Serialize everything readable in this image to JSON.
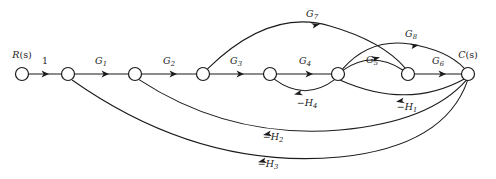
{
  "figure": {
    "type": "signal-flow-graph",
    "background_color": "#ffffff",
    "stroke_color": "#1b1b1b",
    "width": 496,
    "height": 179
  },
  "nodes": [
    {
      "id": "n0",
      "label": "R(s)",
      "label_italic_part": "R",
      "label_arg": "(s)",
      "x": 22,
      "y": 74,
      "r": 6.5,
      "label_x": 22,
      "label_y": 57,
      "kind": "input"
    },
    {
      "id": "n1",
      "label": "",
      "x": 68,
      "y": 74,
      "r": 6.5,
      "kind": "mixing"
    },
    {
      "id": "n2",
      "label": "",
      "x": 135,
      "y": 74,
      "r": 6.5,
      "kind": "mixing"
    },
    {
      "id": "n3",
      "label": "",
      "x": 203,
      "y": 74,
      "r": 6.5,
      "kind": "mixing"
    },
    {
      "id": "n4",
      "label": "",
      "x": 270,
      "y": 74,
      "r": 6.5,
      "kind": "mixing"
    },
    {
      "id": "n5",
      "label": "",
      "x": 338,
      "y": 74,
      "r": 6.5,
      "kind": "mixing"
    },
    {
      "id": "n6",
      "label": "",
      "x": 408,
      "y": 74,
      "r": 6.5,
      "kind": "mixing"
    },
    {
      "id": "n7",
      "label": "C(s)",
      "label_italic_part": "C",
      "label_arg": "(s)",
      "x": 468,
      "y": 74,
      "r": 6.5,
      "label_x": 468,
      "label_y": 57,
      "kind": "output"
    }
  ],
  "edges": [
    {
      "id": "e1",
      "from": "n0",
      "to": "n1",
      "gain": "1",
      "gain_base": "1",
      "gain_sub": "",
      "gain_negative": false,
      "shape": "straight",
      "label_x": 45,
      "label_y": 64,
      "direction": "right"
    },
    {
      "id": "e2",
      "from": "n1",
      "to": "n2",
      "gain": "G1",
      "gain_base": "G",
      "gain_sub": "1",
      "gain_negative": false,
      "shape": "straight",
      "label_x": 101,
      "label_y": 64,
      "direction": "right"
    },
    {
      "id": "e3",
      "from": "n2",
      "to": "n3",
      "gain": "G2",
      "gain_base": "G",
      "gain_sub": "2",
      "gain_negative": false,
      "shape": "straight",
      "label_x": 169,
      "label_y": 64,
      "direction": "right"
    },
    {
      "id": "e4",
      "from": "n3",
      "to": "n4",
      "gain": "G3",
      "gain_base": "G",
      "gain_sub": "3",
      "gain_negative": false,
      "shape": "straight",
      "label_x": 236,
      "label_y": 64,
      "direction": "right"
    },
    {
      "id": "e5",
      "from": "n4",
      "to": "n5",
      "gain": "G4",
      "gain_base": "G",
      "gain_sub": "4",
      "gain_negative": false,
      "shape": "straight",
      "label_x": 305,
      "label_y": 64,
      "direction": "right"
    },
    {
      "id": "e6",
      "from": "n5",
      "to": "n6",
      "gain": "G5",
      "gain_base": "G",
      "gain_sub": "5",
      "gain_negative": false,
      "shape": "arc-up",
      "label_x": 372,
      "label_y": 63,
      "direction": "right"
    },
    {
      "id": "e7",
      "from": "n6",
      "to": "n7",
      "gain": "G6",
      "gain_base": "G",
      "gain_sub": "6",
      "gain_negative": false,
      "shape": "straight",
      "label_x": 438,
      "label_y": 64,
      "direction": "right"
    },
    {
      "id": "e8",
      "from": "n3",
      "to": "n6",
      "gain": "G7",
      "gain_base": "G",
      "gain_sub": "7",
      "gain_negative": false,
      "shape": "arc-up-tall",
      "label_x": 312,
      "label_y": 17,
      "direction": "right"
    },
    {
      "id": "e9",
      "from": "n5",
      "to": "n7",
      "gain": "G8",
      "gain_base": "G",
      "gain_sub": "8",
      "gain_negative": false,
      "shape": "arc-up-mid",
      "label_x": 411,
      "label_y": 37,
      "direction": "right"
    },
    {
      "id": "e10",
      "from": "n5",
      "to": "n4",
      "gain": "-H4",
      "gain_base": "H",
      "gain_sub": "4",
      "gain_negative": true,
      "shape": "arc-down-small",
      "label_x": 307,
      "label_y": 106,
      "direction": "left"
    },
    {
      "id": "e11",
      "from": "n7",
      "to": "n5",
      "gain": "-H1",
      "gain_base": "H",
      "gain_sub": "1",
      "gain_negative": true,
      "shape": "arc-down-small2",
      "label_x": 407,
      "label_y": 110,
      "direction": "left"
    },
    {
      "id": "e12",
      "from": "n7",
      "to": "n2",
      "gain": "-H2",
      "gain_base": "H",
      "gain_sub": "2",
      "gain_negative": true,
      "shape": "arc-down-mid",
      "label_x": 273,
      "label_y": 140,
      "direction": "left"
    },
    {
      "id": "e13",
      "from": "n7",
      "to": "n1",
      "gain": "-H3",
      "gain_base": "H",
      "gain_sub": "3",
      "gain_negative": true,
      "shape": "arc-down-tall",
      "label_x": 268,
      "label_y": 167,
      "direction": "left"
    }
  ],
  "labels": {
    "input_node": "R(s)",
    "output_node": "C(s)",
    "gains": [
      "1",
      "G1",
      "G2",
      "G3",
      "G4",
      "G5",
      "G6",
      "G7",
      "G8"
    ],
    "feedbacks": [
      "-H1",
      "-H2",
      "-H3",
      "-H4"
    ]
  }
}
